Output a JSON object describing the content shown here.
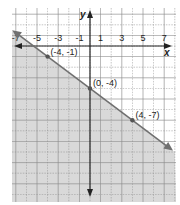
{
  "chart_data": {
    "type": "line",
    "title": "",
    "xlabel": "x",
    "ylabel": "y",
    "xlim": [
      -7.5,
      7.5
    ],
    "ylim": [
      -14.5,
      3.5
    ],
    "x_tick_labels": [
      "-7",
      "-5",
      "-3",
      "-1",
      "1",
      "3",
      "5",
      "7"
    ],
    "x_ticks": [
      -7,
      -5,
      -3,
      -1,
      1,
      3,
      5,
      7
    ],
    "grid": true,
    "line": {
      "equation": "y = -3/4 x - 4",
      "slope": -0.75,
      "intercept": -4,
      "style": "solid"
    },
    "shaded_region": "below line",
    "points": [
      {
        "x": -4,
        "y": -1,
        "label": "(-4, -1)"
      },
      {
        "x": 0,
        "y": -4,
        "label": "(0, -4)"
      },
      {
        "x": 4,
        "y": -7,
        "label": "(4, -7)"
      }
    ]
  },
  "colors": {
    "shade": "#d9d9d9",
    "line": "#707070",
    "axis": "#222222",
    "grid": "#8a8a8a",
    "point": "#555555"
  }
}
